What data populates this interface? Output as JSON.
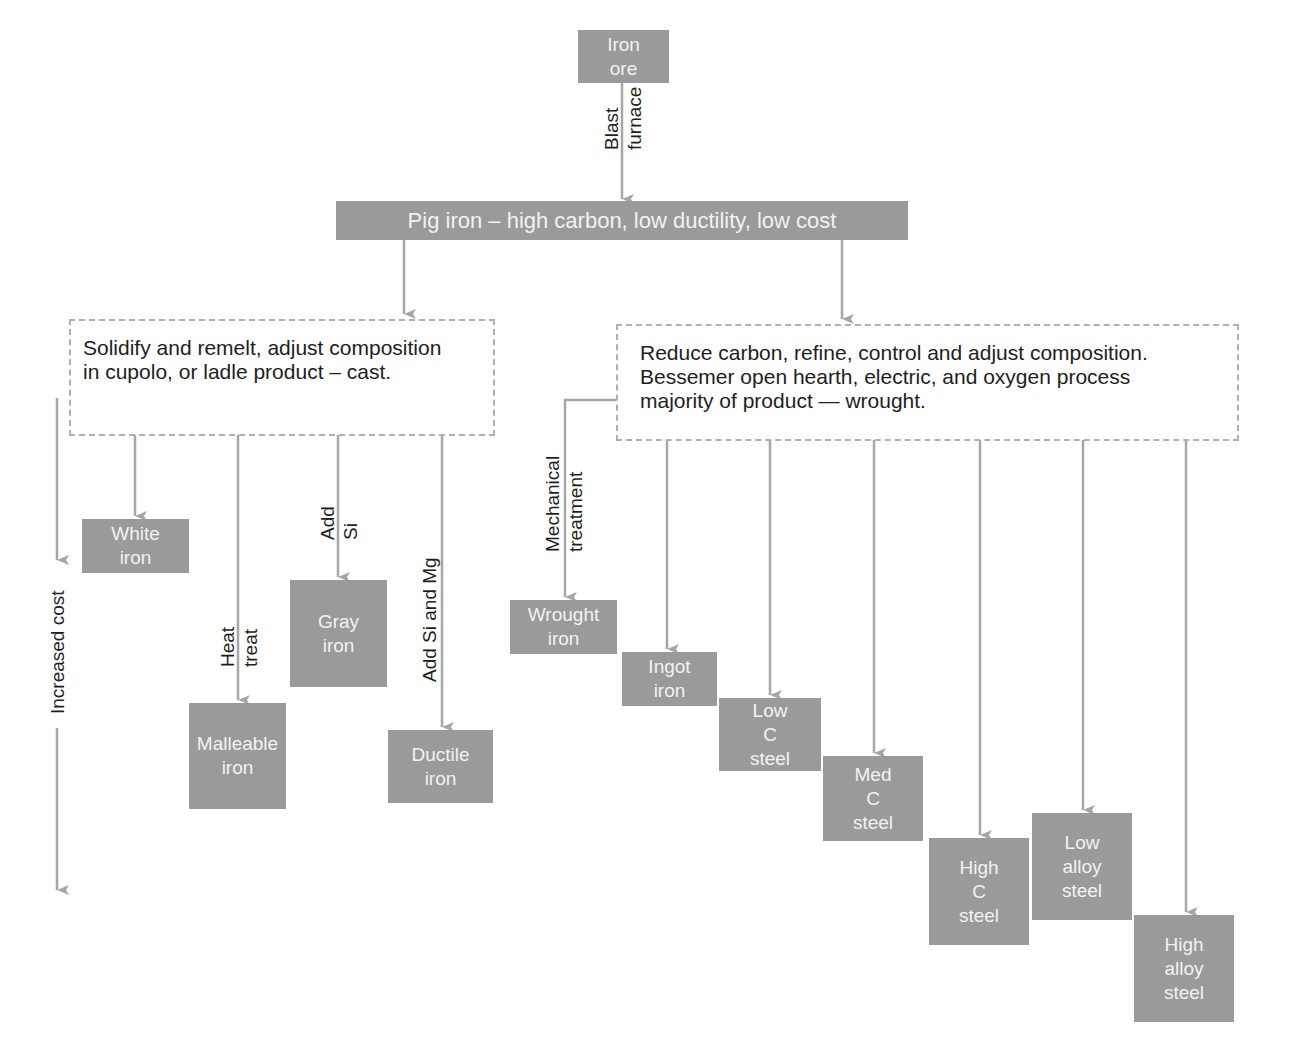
{
  "colors": {
    "box_fill": "#9a9a9a",
    "box_text": "#f2f2f2",
    "arrow": "#a6a6a6",
    "dashed_border": "#b0b0b0",
    "label_text": "#1e1e1e"
  },
  "nodes": {
    "iron_ore": "Iron\nore",
    "pig_iron": "Pig iron – high carbon, low ductility, low cost",
    "cast_process": "Solidify and remelt, adjust composition\nin cupolo, or ladle product – cast.",
    "wrought_process": "Reduce carbon, refine, control and adjust composition.\nBessemer open hearth, electric, and oxygen process\nmajority of product — wrought.",
    "white_iron": "White\niron",
    "malleable_iron": "Malleable\niron",
    "gray_iron": "Gray\niron",
    "ductile_iron": "Ductile\niron",
    "wrought_iron": "Wrought\niron",
    "ingot_iron": "Ingot\niron",
    "low_c_steel": "Low\nC\nsteel",
    "med_c_steel": "Med\nC\nsteel",
    "high_c_steel": "High\nC\nsteel",
    "low_alloy_steel": "Low\nalloy\nsteel",
    "high_alloy_steel": "High\nalloy\nsteel"
  },
  "edge_labels": {
    "blast_furnace": "Blast\nfurnace",
    "heat_treat": "Heat\ntreat",
    "add_si": "Add\nSi",
    "add_si_mg": "Add Si and Mg",
    "mechanical_treatment": "Mechanical\ntreatment"
  },
  "axis": {
    "cost_label": "Increased cost"
  }
}
